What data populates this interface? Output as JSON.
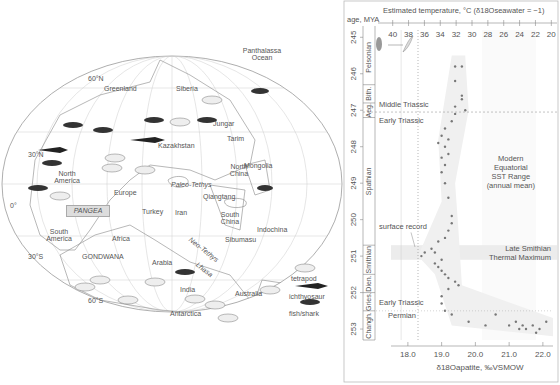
{
  "map": {
    "latitude_labels": [
      "60°N",
      "30°N",
      "0°",
      "30°S",
      "60°S"
    ],
    "continent_labels": {
      "pangea": "PANGEA",
      "gondwana": "GONDWANA",
      "greenland": "Greenland",
      "siberia": "Siberia",
      "jungar": "Jungar",
      "tarim": "Tarim",
      "kazakhstan": "Kazakhstan",
      "north_america": "North America",
      "europe": "Europe",
      "mongolia": "Mongolia",
      "north_china": "North China",
      "paleo_tethys": "Paleo-Tethys",
      "qiangtang": "Qiangtang",
      "turkey": "Turkey",
      "iran": "Iran",
      "south_china": "South China",
      "indochina": "Indochina",
      "sibumasu": "Sibumasu",
      "south_america": "South America",
      "africa": "Africa",
      "arabia": "Arabia",
      "neo_tethys": "Neo-Tethys",
      "lhasa": "Lhasa",
      "india": "India",
      "australia": "Australia",
      "antarctica": "Antarctica",
      "panthalassa": "Panthalassa Ocean"
    },
    "legend": [
      {
        "icon": "tetrapod-icon",
        "label": "tetrapod"
      },
      {
        "icon": "ichthyosaur-icon",
        "label": "ichthyosaur"
      },
      {
        "icon": "fish-shark-icon",
        "label": "fish/shark"
      }
    ]
  },
  "chart_data": {
    "type": "scatter",
    "title": "",
    "top_axis_label": "Estimated temperature, °C (δ18Oseawater = −1)",
    "top_axis_ticks": [
      40,
      38,
      36,
      34,
      32,
      30,
      28,
      26,
      24,
      22,
      20
    ],
    "xlabel": "δ18Oapatite, ‰VSMOW",
    "x_ticks": [
      "18.0",
      "19.0",
      "20.0",
      "21.0",
      "22.0"
    ],
    "xlim": [
      17.5,
      22.3
    ],
    "ylabel": "age, MYA",
    "y_ticks": [
      245,
      246,
      247,
      248,
      249,
      250,
      251,
      252,
      253
    ],
    "ylim": [
      244.8,
      253.3
    ],
    "stages": [
      {
        "name": "Pelsonian",
        "from": 244.8,
        "to": 246.3
      },
      {
        "name": "Bith.",
        "from": 246.3,
        "to": 246.8
      },
      {
        "name": "Aeg.",
        "from": 246.8,
        "to": 247.2
      },
      {
        "name": "Spathian",
        "from": 247.2,
        "to": 250.7
      },
      {
        "name": "Smithian",
        "from": 250.7,
        "to": 251.5
      },
      {
        "name": "Dien.",
        "from": 251.5,
        "to": 252.0
      },
      {
        "name": "Gries.",
        "from": 252.0,
        "to": 252.5
      },
      {
        "name": "Changh.",
        "from": 252.5,
        "to": 253.3
      }
    ],
    "annotations": [
      {
        "text": "Middle Triassic",
        "y": 246.9
      },
      {
        "text": "Early Triassic",
        "y": 247.2
      },
      {
        "text": "surface record",
        "y": 250.3
      },
      {
        "text": "Modern Equatorial SST Range (annual mean)",
        "y": 248.8
      },
      {
        "text": "Late Smithian Thermal Maximum",
        "y": 250.9
      },
      {
        "text": "Early Triassic",
        "y": 252.4
      },
      {
        "text": "Permian",
        "y": 252.7
      }
    ],
    "highlight_band": {
      "label": "Late Smithian Thermal Maximum",
      "from": 250.7,
      "to": 251.1
    },
    "sst_range_x": [
      20.2,
      21.8
    ],
    "surface_record_x": 18.3,
    "points": [
      [
        19.4,
        245.8
      ],
      [
        19.6,
        245.8
      ],
      [
        19.4,
        246.2
      ],
      [
        19.6,
        246.6
      ],
      [
        19.6,
        246.7
      ],
      [
        19.4,
        246.9
      ],
      [
        19.4,
        247.1
      ],
      [
        19.7,
        247.0
      ],
      [
        19.3,
        247.3
      ],
      [
        19.1,
        247.5
      ],
      [
        19.0,
        247.7
      ],
      [
        18.9,
        247.9
      ],
      [
        19.2,
        247.8
      ],
      [
        19.1,
        248.0
      ],
      [
        19.0,
        248.3
      ],
      [
        19.2,
        248.2
      ],
      [
        19.1,
        248.5
      ],
      [
        19.0,
        248.7
      ],
      [
        19.1,
        249.0
      ],
      [
        19.2,
        249.4
      ],
      [
        19.3,
        249.9
      ],
      [
        19.3,
        250.1
      ],
      [
        19.2,
        250.3
      ],
      [
        19.1,
        250.5
      ],
      [
        18.9,
        250.6
      ],
      [
        18.7,
        250.8
      ],
      [
        18.5,
        250.9
      ],
      [
        18.4,
        251.0
      ],
      [
        18.8,
        250.9
      ],
      [
        19.0,
        251.1
      ],
      [
        18.8,
        251.2
      ],
      [
        18.9,
        251.3
      ],
      [
        19.0,
        251.4
      ],
      [
        19.1,
        251.5
      ],
      [
        19.2,
        251.6
      ],
      [
        19.4,
        251.7
      ],
      [
        19.5,
        251.8
      ],
      [
        19.2,
        251.9
      ],
      [
        19.0,
        252.1
      ],
      [
        19.0,
        252.3
      ],
      [
        19.1,
        252.5
      ],
      [
        19.3,
        252.6
      ],
      [
        19.8,
        252.8
      ],
      [
        20.3,
        252.9
      ],
      [
        21.0,
        252.9
      ],
      [
        21.2,
        252.8
      ],
      [
        21.4,
        252.9
      ],
      [
        21.5,
        253.0
      ],
      [
        21.7,
        252.9
      ],
      [
        21.9,
        253.0
      ],
      [
        22.1,
        252.8
      ],
      [
        21.8,
        253.1
      ],
      [
        21.3,
        253.0
      ],
      [
        20.6,
        252.6
      ]
    ]
  }
}
